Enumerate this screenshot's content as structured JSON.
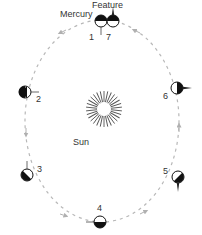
{
  "title_labels": {
    "mercury": "Mercury",
    "feature": "Feature",
    "sun": "Sun"
  },
  "positions": [
    {
      "id": "1",
      "label": "1"
    },
    {
      "id": "2",
      "label": "2"
    },
    {
      "id": "3",
      "label": "3"
    },
    {
      "id": "4",
      "label": "4"
    },
    {
      "id": "5",
      "label": "5"
    },
    {
      "id": "6",
      "label": "6"
    },
    {
      "id": "7",
      "label": "7"
    }
  ],
  "colors": {
    "orbit": "#b8b8b8",
    "planet_dark": "#111111",
    "planet_light": "#ffffff",
    "sun_rays": "#555555",
    "text": "#333333"
  }
}
